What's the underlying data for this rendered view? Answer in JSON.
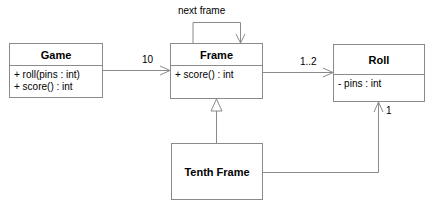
{
  "classes": {
    "game": {
      "name": "Game",
      "members": [
        "+ roll(pins : int)",
        "+ score() : int"
      ]
    },
    "frame": {
      "name": "Frame",
      "members": [
        "+ score() : int"
      ]
    },
    "roll": {
      "name": "Roll",
      "members": [
        "- pins : int"
      ]
    },
    "tenth_frame": {
      "name": "Tenth Frame",
      "members": []
    }
  },
  "associations": {
    "game_frame_multiplicity": "10",
    "frame_roll_multiplicity": "1..2",
    "frame_self_label": "next frame",
    "tenth_roll_multiplicity": "1"
  }
}
